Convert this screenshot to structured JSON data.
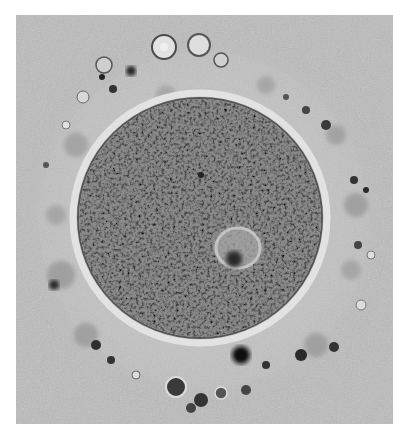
{
  "image": {
    "subject": "micrograph of an oocyte with granular cytoplasm, nucleus (germinal vesicle) and surrounding cumulus cells",
    "style": "grayscale brightfield microscopy",
    "colors": {
      "background": "#bdbdbd",
      "cytoplasm": "#7a7a7a",
      "zona": "#d8d8d8",
      "cumulus_dark": "#2a2a2a",
      "page": "#ffffff"
    }
  }
}
